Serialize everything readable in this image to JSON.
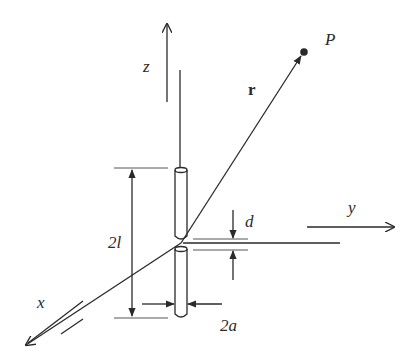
{
  "diagram": {
    "type": "dipole-antenna-geometry",
    "labels": {
      "z_axis": "z",
      "y_axis": "y",
      "x_axis": "x",
      "point": "P",
      "vector": "r",
      "length": "2l",
      "gap": "d",
      "diameter": "2a"
    },
    "colors": {
      "line": "#2a2a2a",
      "background": "#ffffff"
    }
  }
}
